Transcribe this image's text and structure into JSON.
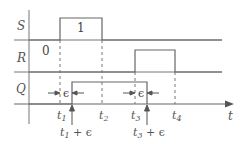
{
  "diagram": {
    "type": "timing-diagram",
    "signals": [
      {
        "name": "S",
        "value_label": "1",
        "high_from": "t1",
        "high_to": "t2"
      },
      {
        "name": "R",
        "value_label": "0",
        "high_from": "t3",
        "high_to": "t4"
      },
      {
        "name": "Q",
        "high_from": "t1 + ε",
        "high_to": "t3 + ε"
      }
    ],
    "time_marks": [
      "t1",
      "t2",
      "t3",
      "t4"
    ],
    "delay_labels": [
      "t1 + ε",
      "t3 + ε"
    ],
    "epsilon": "ϵ",
    "axis_label": "t",
    "colors": {
      "line": "#666666",
      "text": "#555555"
    }
  },
  "labels": {
    "S": "S",
    "R": "R",
    "Q": "Q",
    "one": "1",
    "zero": "0",
    "t1": "t",
    "t1_sub": "1",
    "t2": "t",
    "t2_sub": "2",
    "t3": "t",
    "t3_sub": "3",
    "t4": "t",
    "t4_sub": "4",
    "t1e": "t",
    "t1e_sub": "1",
    "t1e_suffix": " + ϵ",
    "t3e": "t",
    "t3e_sub": "3",
    "t3e_suffix": " + ϵ",
    "eps1": "ϵ",
    "eps2": "ϵ",
    "axis": "t"
  }
}
